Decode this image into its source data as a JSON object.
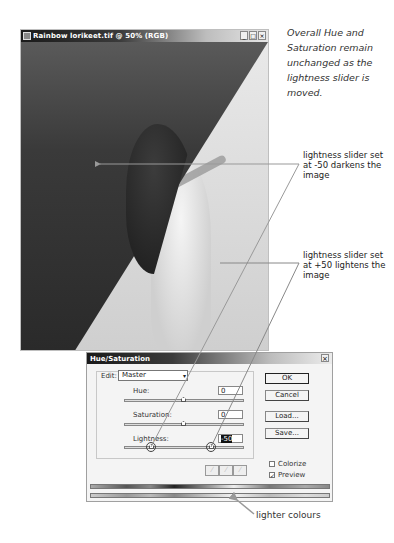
{
  "image_window": {
    "title": "Rainbow lorikeet.tif @ 50% (RGB)",
    "controls": {
      "minimize": "_",
      "maximize": "□",
      "close": "×"
    }
  },
  "annotations": {
    "caption": "Overall Hue and Saturation remain unchanged as the lightness slider is moved.",
    "note_darken": "lightness slider set at -50 darkens the image",
    "note_lighten": "lightness slider set at +50 lightens the image",
    "note_lighter_colours": "lighter colours"
  },
  "dialog": {
    "title": "Hue/Saturation",
    "close": "×",
    "edit_label": "Edit:",
    "edit_value": "Master",
    "sliders": [
      {
        "label": "Hue:",
        "value": "0"
      },
      {
        "label": "Saturation:",
        "value": "0"
      },
      {
        "label": "Lightness:",
        "value": "-50"
      }
    ],
    "buttons": {
      "ok": "OK",
      "cancel": "Cancel",
      "load": "Load...",
      "save": "Save..."
    },
    "eyedroppers": [
      "eyedropper",
      "eyedropper-plus",
      "eyedropper-minus"
    ],
    "checkboxes": [
      {
        "label": "Colorize",
        "checked": false
      },
      {
        "label": "Preview",
        "checked": true
      }
    ],
    "checkmark": "✓"
  },
  "colors": {
    "titlebar_dark": "#1a1a1a",
    "dialog_bg": "#f4f4f4",
    "annotation_line": "#888888"
  }
}
